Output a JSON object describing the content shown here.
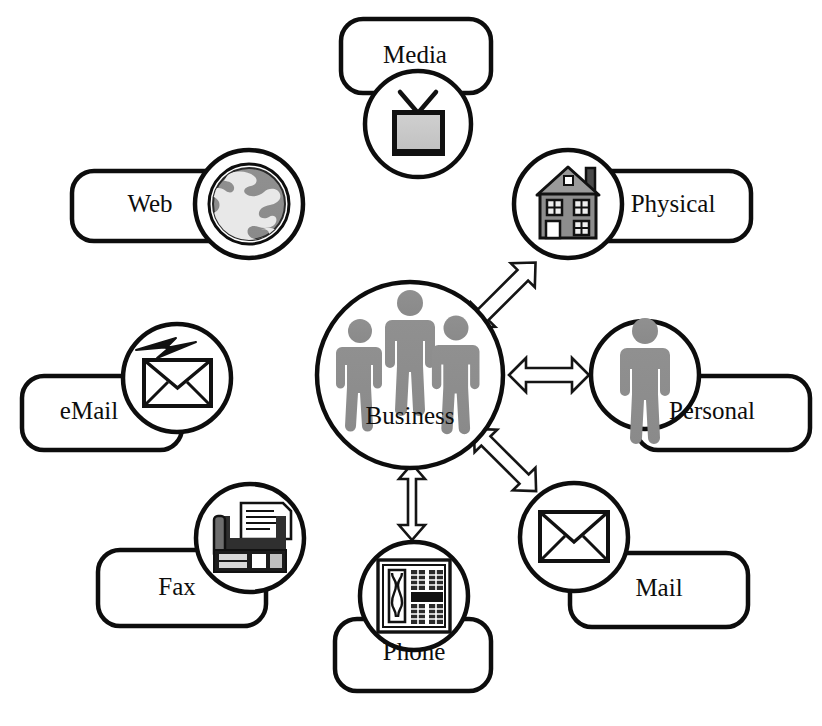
{
  "diagram": {
    "background_color": "#ffffff",
    "line_color": "#0d0d0d",
    "icon_gray": "#8c8c8c",
    "icon_light_gray": "#c6c6c6",
    "center": {
      "id": "business",
      "label": "Business",
      "icon": "three-people-icon",
      "cx": 410,
      "cy": 375,
      "r": 93
    },
    "nodes": [
      {
        "id": "media",
        "label": "Media",
        "icon": "television-icon",
        "cx": 418,
        "cy": 124,
        "r": 53,
        "label_x": 415,
        "label_y": 57,
        "pill_x": 341,
        "pill_y": 19,
        "pill_w": 150,
        "pill_h": 74,
        "label_pos": "above"
      },
      {
        "id": "web",
        "label": "Web",
        "icon": "globe-icon",
        "cx": 249,
        "cy": 204,
        "r": 54,
        "label_x": 150,
        "label_y": 206,
        "pill_x": 72,
        "pill_y": 171,
        "pill_w": 188,
        "pill_h": 70,
        "label_pos": "left"
      },
      {
        "id": "email",
        "label": "eMail",
        "icon": "envelope-lightning-icon",
        "cx": 177,
        "cy": 378,
        "r": 54,
        "label_x": 89,
        "label_y": 413,
        "pill_x": 22,
        "pill_y": 376,
        "pill_w": 160,
        "pill_h": 74,
        "label_pos": "left-below"
      },
      {
        "id": "fax",
        "label": "Fax",
        "icon": "fax-machine-icon",
        "cx": 250,
        "cy": 538,
        "r": 54,
        "label_x": 177,
        "label_y": 589,
        "pill_x": 98,
        "pill_y": 550,
        "pill_w": 168,
        "pill_h": 76,
        "label_pos": "left-below"
      },
      {
        "id": "phone",
        "label": "Phone",
        "icon": "desk-phone-icon",
        "cx": 414,
        "cy": 596,
        "r": 54,
        "label_x": 414,
        "label_y": 654,
        "pill_x": 335,
        "pill_y": 619,
        "pill_w": 156,
        "pill_h": 72,
        "label_pos": "below"
      },
      {
        "id": "mail",
        "label": "Mail",
        "icon": "envelope-icon",
        "cx": 574,
        "cy": 537,
        "r": 54,
        "label_x": 659,
        "label_y": 590,
        "pill_x": 570,
        "pill_y": 553,
        "pill_w": 178,
        "pill_h": 74,
        "label_pos": "right-below"
      },
      {
        "id": "personal",
        "label": "Personal",
        "icon": "single-person-icon",
        "cx": 645,
        "cy": 375,
        "r": 54,
        "label_x": 712,
        "label_y": 413,
        "pill_x": 636,
        "pill_y": 376,
        "pill_w": 174,
        "pill_h": 74,
        "label_pos": "right-below"
      },
      {
        "id": "physical",
        "label": "Physical",
        "icon": "house-icon",
        "cx": 568,
        "cy": 204,
        "r": 54,
        "label_x": 673,
        "label_y": 206,
        "pill_x": 561,
        "pill_y": 171,
        "pill_w": 190,
        "pill_h": 70,
        "label_pos": "right"
      }
    ],
    "connectors": [
      {
        "id": "business-physical",
        "from": "business",
        "to": "physical",
        "style": "double-headed-arrow",
        "direction": "diagonal-up-right"
      },
      {
        "id": "business-personal",
        "from": "business",
        "to": "personal",
        "style": "double-headed-arrow",
        "direction": "horizontal-right"
      },
      {
        "id": "business-mail",
        "from": "business",
        "to": "mail",
        "style": "double-headed-arrow",
        "direction": "diagonal-down-right"
      },
      {
        "id": "business-phone",
        "from": "business",
        "to": "phone",
        "style": "double-headed-arrow",
        "direction": "vertical-down"
      }
    ]
  }
}
